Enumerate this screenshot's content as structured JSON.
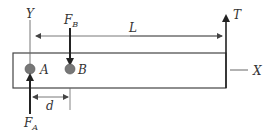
{
  "diagram": {
    "labels": {
      "y_axis": "Y",
      "x_axis": "X",
      "force_b": "F",
      "force_b_sub": "B",
      "force_a": "F",
      "force_a_sub": "A",
      "tension": "T",
      "length": "L",
      "distance": "d",
      "point_a": "A",
      "point_b": "B"
    },
    "colors": {
      "line": "#333333",
      "thin_line": "#555555",
      "point_fill": "#777777"
    }
  }
}
